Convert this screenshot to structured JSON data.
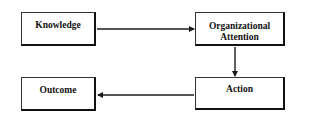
{
  "diagram": {
    "type": "flowchart",
    "nodes": [
      {
        "id": "knowledge",
        "label": "Knowledge"
      },
      {
        "id": "organizational_attention",
        "label_lines": [
          "Organizational",
          "Attention"
        ]
      },
      {
        "id": "action",
        "label": "Action"
      },
      {
        "id": "outcome",
        "label": "Outcome"
      }
    ],
    "edges": [
      {
        "from": "knowledge",
        "to": "organizational_attention"
      },
      {
        "from": "organizational_attention",
        "to": "action"
      },
      {
        "from": "action",
        "to": "outcome"
      }
    ],
    "colors": {
      "line": "#1a1a1a",
      "background": "#ffffff"
    }
  }
}
